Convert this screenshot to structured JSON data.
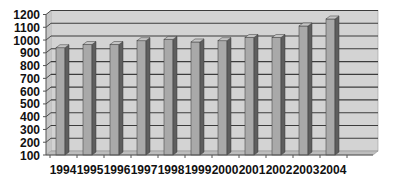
{
  "chart_data": {
    "type": "bar",
    "style": "3d-column",
    "title": "",
    "xlabel": "",
    "ylabel": "",
    "categories": [
      "1994",
      "1995",
      "1996",
      "1997",
      "1998",
      "1999",
      "2000",
      "2001",
      "2002",
      "2003",
      "2004"
    ],
    "values": [
      940,
      965,
      965,
      995,
      1005,
      985,
      995,
      1020,
      1020,
      1110,
      1165
    ],
    "ylim": [
      100,
      1200
    ],
    "yticks": [
      100,
      200,
      300,
      400,
      500,
      600,
      700,
      800,
      900,
      1000,
      1100,
      1200
    ],
    "grid": true,
    "legend": null
  },
  "colors": {
    "wall": "#d3d3d3",
    "floor": "#bdbdbd",
    "gridline": "#3c3c3c",
    "bar_front": "#a9a9a9",
    "bar_side": "#5e5e5e",
    "bar_top": "#c4c4c4",
    "axis": "#555555",
    "label": "#111111"
  }
}
